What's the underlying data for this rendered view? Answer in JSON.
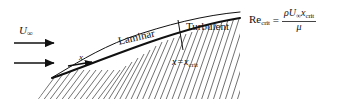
{
  "figure": {
    "background_color": "#ffffff",
    "line_color": "#111111",
    "hatch_color": "#333333"
  },
  "labels": {
    "freestream_velocity": "U",
    "freestream_subscript": "∞",
    "distance_x": "x",
    "laminar": "Laminar",
    "turbulent": "Turbulent",
    "x_equals": "x",
    "x_equals_sign": "=",
    "x_equals_value": "x",
    "x_equals_value_sub": "crit"
  },
  "formula": {
    "symbol": "Re",
    "symbol_sub": "crit",
    "equals": "=",
    "numerator_rho": "ρ",
    "numerator_U": "U",
    "numerator_U_sub": "∞",
    "numerator_x": "x",
    "numerator_x_sub": "crit",
    "denominator": "μ"
  }
}
